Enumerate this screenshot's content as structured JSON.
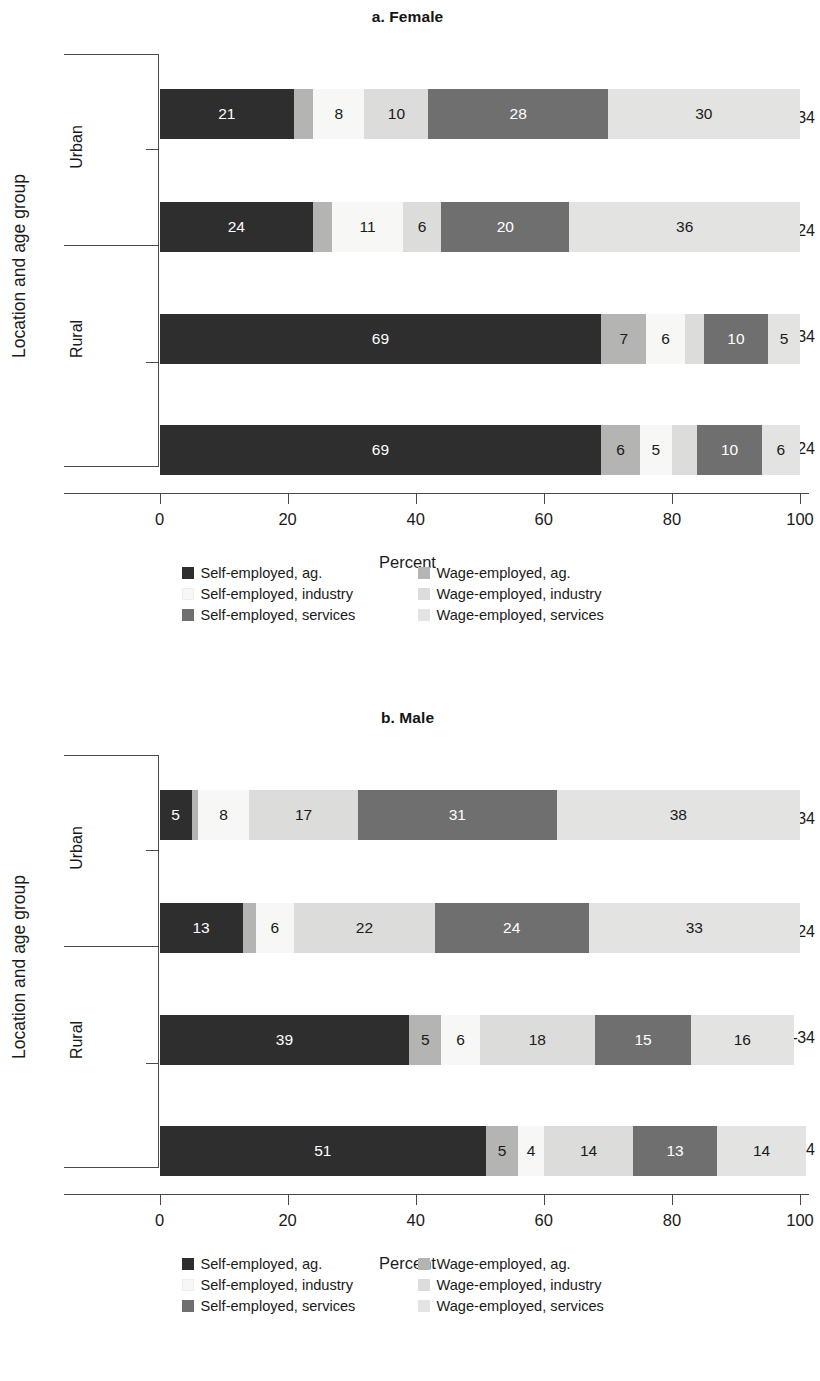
{
  "figure": {
    "yaxis_title": "Location and age group",
    "xaxis_title": "Percent",
    "x_ticks": [
      "0",
      "20",
      "40",
      "60",
      "80",
      "100"
    ],
    "group_labels": [
      "Urban",
      "Rural"
    ],
    "category_labels": [
      "25–34",
      "16–24",
      "25–34",
      "16–24"
    ]
  },
  "legend": {
    "items": [
      {
        "label": "Self-employed, ag.",
        "color": "#2e2e2e",
        "key": "self_ag"
      },
      {
        "label": "Wage-employed, ag.",
        "color": "#b4b4b2",
        "key": "wage_ag"
      },
      {
        "label": "Self-employed, industry",
        "color": "#f7f7f5",
        "key": "self_ind"
      },
      {
        "label": "Wage-employed, industry",
        "color": "#dcdcda",
        "key": "wage_ind"
      },
      {
        "label": "Self-employed, services",
        "color": "#6f6f6f",
        "key": "self_serv"
      },
      {
        "label": "Wage-employed, services",
        "color": "#e3e3e1",
        "key": "wage_serv"
      }
    ]
  },
  "chart_data": [
    {
      "type": "bar",
      "orientation": "horizontal",
      "stacked": true,
      "title": "a. Female",
      "xlabel": "Percent",
      "ylabel": "Location and age group",
      "xlim": [
        0,
        100
      ],
      "grid": false,
      "legend_position": "bottom",
      "categories": [
        {
          "group": "Urban",
          "age": "25–34"
        },
        {
          "group": "Urban",
          "age": "16–24"
        },
        {
          "group": "Rural",
          "age": "25–34"
        },
        {
          "group": "Rural",
          "age": "16–24"
        }
      ],
      "series": [
        {
          "name": "Self-employed, ag.",
          "color": "#2e2e2e",
          "values": [
            21,
            24,
            69,
            69
          ],
          "labels": [
            "21",
            "24",
            "69",
            "69"
          ]
        },
        {
          "name": "Wage-employed, ag.",
          "color": "#b4b4b2",
          "values": [
            3,
            3,
            7,
            6
          ],
          "labels": [
            "",
            "",
            "7",
            "6"
          ]
        },
        {
          "name": "Self-employed, industry",
          "color": "#f7f7f5",
          "values": [
            8,
            11,
            6,
            5
          ],
          "labels": [
            "8",
            "11",
            "6",
            "5"
          ]
        },
        {
          "name": "Wage-employed, industry",
          "color": "#dcdcda",
          "values": [
            10,
            6,
            3,
            4
          ],
          "labels": [
            "10",
            "6",
            "",
            ""
          ]
        },
        {
          "name": "Self-employed, services",
          "color": "#6f6f6f",
          "values": [
            28,
            20,
            10,
            10
          ],
          "labels": [
            "28",
            "20",
            "10",
            "10"
          ]
        },
        {
          "name": "Wage-employed, services",
          "color": "#e3e3e1",
          "values": [
            30,
            36,
            5,
            6
          ],
          "labels": [
            "30",
            "36",
            "5",
            "6"
          ]
        }
      ]
    },
    {
      "type": "bar",
      "orientation": "horizontal",
      "stacked": true,
      "title": "b. Male",
      "xlabel": "Percent",
      "ylabel": "Location and age group",
      "xlim": [
        0,
        100
      ],
      "grid": false,
      "legend_position": "bottom",
      "categories": [
        {
          "group": "Urban",
          "age": "25–34"
        },
        {
          "group": "Urban",
          "age": "16–24"
        },
        {
          "group": "Rural",
          "age": "25–34"
        },
        {
          "group": "Rural",
          "age": "16–24"
        }
      ],
      "series": [
        {
          "name": "Self-employed, ag.",
          "color": "#2e2e2e",
          "values": [
            5,
            13,
            39,
            51
          ],
          "labels": [
            "5",
            "13",
            "39",
            "51"
          ]
        },
        {
          "name": "Wage-employed, ag.",
          "color": "#b4b4b2",
          "values": [
            1,
            2,
            5,
            5
          ],
          "labels": [
            "",
            "",
            "5",
            "5"
          ]
        },
        {
          "name": "Self-employed, industry",
          "color": "#f7f7f5",
          "values": [
            8,
            6,
            6,
            4
          ],
          "labels": [
            "8",
            "6",
            "6",
            "4"
          ]
        },
        {
          "name": "Wage-employed, industry",
          "color": "#dcdcda",
          "values": [
            17,
            22,
            18,
            14
          ],
          "labels": [
            "17",
            "22",
            "18",
            "14"
          ]
        },
        {
          "name": "Self-employed, services",
          "color": "#6f6f6f",
          "values": [
            31,
            24,
            15,
            13
          ],
          "labels": [
            "31",
            "24",
            "15",
            "13"
          ]
        },
        {
          "name": "Wage-employed, services",
          "color": "#e3e3e1",
          "values": [
            38,
            33,
            16,
            14
          ],
          "labels": [
            "38",
            "33",
            "16",
            "14"
          ]
        }
      ]
    }
  ]
}
